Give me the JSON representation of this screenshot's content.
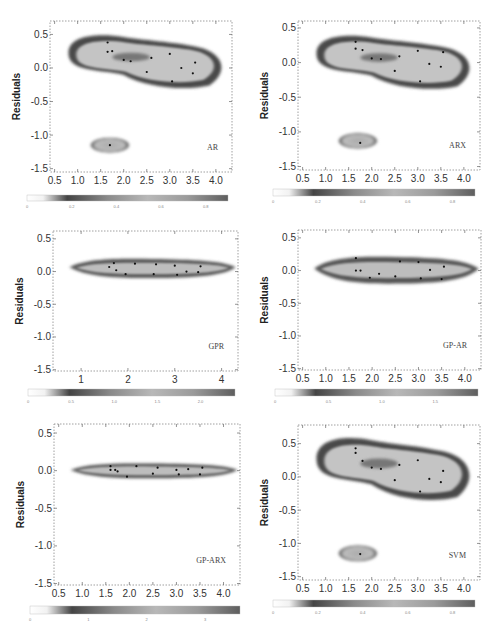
{
  "figure": {
    "header_text": ""
  },
  "chart_data": [
    {
      "type": "heatmap",
      "model": "AR",
      "xlabel": "",
      "ylabel": "Residuals",
      "xlim": [
        0.4,
        4.35
      ],
      "ylim": [
        -1.55,
        0.7
      ],
      "x_ticks": [
        "0.5",
        "1.0",
        "1.5",
        "2.0",
        "2.5",
        "3.0",
        "3.5",
        "4.0"
      ],
      "x_tick_values": [
        0.5,
        1.0,
        1.5,
        2.0,
        2.5,
        3.0,
        3.5,
        4.0
      ],
      "y_ticks": [
        "0.5",
        "0.0",
        "-0.5",
        "-1.0",
        "-1.5"
      ],
      "y_tick_values": [
        0.5,
        0.0,
        -0.5,
        -1.0,
        -1.5
      ],
      "colorbar_ticks": [
        "0",
        "0.2",
        "0.4",
        "0.6",
        "0.8"
      ],
      "colorbar_range": [
        0,
        0.9
      ],
      "points": [
        [
          1.65,
          0.38
        ],
        [
          1.65,
          0.24
        ],
        [
          1.75,
          0.25
        ],
        [
          2.0,
          0.12
        ],
        [
          2.15,
          0.1
        ],
        [
          2.6,
          0.15
        ],
        [
          2.5,
          -0.06
        ],
        [
          3.0,
          0.21
        ],
        [
          3.25,
          0.0
        ],
        [
          3.55,
          0.08
        ],
        [
          3.5,
          -0.08
        ],
        [
          3.05,
          -0.2
        ],
        [
          1.7,
          -1.15
        ]
      ],
      "density_blobs": [
        {
          "shape": "main",
          "cx_range": [
            0.8,
            4.2
          ],
          "cy_range": [
            -0.3,
            0.5
          ]
        },
        {
          "shape": "outlier",
          "cx": 1.7,
          "cy": -1.15,
          "rx": 0.45,
          "ry": 0.12
        }
      ],
      "grid": false
    },
    {
      "type": "heatmap",
      "model": "ARX",
      "xlabel": "",
      "ylabel": "Residuals",
      "xlim": [
        0.4,
        4.35
      ],
      "ylim": [
        -1.55,
        0.6
      ],
      "x_ticks": [
        "0.5",
        "1.0",
        "1.5",
        "2.0",
        "2.5",
        "3.0",
        "3.5",
        "4.0"
      ],
      "x_tick_values": [
        0.5,
        1.0,
        1.5,
        2.0,
        2.5,
        3.0,
        3.5,
        4.0
      ],
      "y_ticks": [
        "0.5",
        "0.0",
        "-0.5",
        "-1.0",
        "-1.5"
      ],
      "y_tick_values": [
        0.5,
        0.0,
        -0.5,
        -1.0,
        -1.5
      ],
      "colorbar_ticks": [
        "0",
        "0.2",
        "0.4",
        "0.6",
        "0.8"
      ],
      "colorbar_range": [
        0,
        0.9
      ],
      "points": [
        [
          1.65,
          0.3
        ],
        [
          1.65,
          0.2
        ],
        [
          1.8,
          0.18
        ],
        [
          2.0,
          0.06
        ],
        [
          2.2,
          0.05
        ],
        [
          2.6,
          0.09
        ],
        [
          2.5,
          -0.12
        ],
        [
          3.0,
          0.17
        ],
        [
          3.25,
          -0.02
        ],
        [
          3.55,
          0.15
        ],
        [
          3.5,
          -0.06
        ],
        [
          3.05,
          -0.27
        ],
        [
          1.75,
          -1.16
        ]
      ],
      "density_blobs": [
        {
          "shape": "main",
          "cx_range": [
            0.8,
            4.2
          ],
          "cy_range": [
            -0.38,
            0.4
          ]
        },
        {
          "shape": "outlier",
          "cx": 1.7,
          "cy": -1.13,
          "rx": 0.45,
          "ry": 0.12
        }
      ],
      "grid": false
    },
    {
      "type": "heatmap",
      "model": "GPR",
      "xlabel": "",
      "ylabel": "Residuals",
      "xlim": [
        0.4,
        4.35
      ],
      "ylim": [
        -1.52,
        0.62
      ],
      "x_ticks": [
        "1",
        "2",
        "3",
        "4"
      ],
      "x_tick_values": [
        1,
        2,
        3,
        4
      ],
      "y_ticks": [
        "0.5",
        "0.0",
        "-0.5",
        "-1.0",
        "-1.5"
      ],
      "y_tick_values": [
        0.5,
        0.0,
        -0.5,
        -1.0,
        -1.5
      ],
      "colorbar_ticks": [
        "0",
        "0.5",
        "1.0",
        "1.5",
        "2.0"
      ],
      "colorbar_range": [
        0,
        2.4
      ],
      "points": [
        [
          1.6,
          0.07
        ],
        [
          1.7,
          0.13
        ],
        [
          1.75,
          0.02
        ],
        [
          1.95,
          -0.04
        ],
        [
          2.15,
          0.12
        ],
        [
          2.55,
          -0.04
        ],
        [
          2.6,
          0.11
        ],
        [
          3.0,
          0.09
        ],
        [
          3.05,
          -0.05
        ],
        [
          3.25,
          0.0
        ],
        [
          3.5,
          -0.01
        ],
        [
          3.55,
          0.08
        ]
      ],
      "density_blobs": [
        {
          "shape": "band",
          "cx_range": [
            0.75,
            4.3
          ],
          "cy_range": [
            -0.1,
            0.2
          ]
        }
      ],
      "grid": false
    },
    {
      "type": "heatmap",
      "model": "GP-AR",
      "xlabel": "",
      "ylabel": "Residuals",
      "xlim": [
        0.4,
        4.35
      ],
      "ylim": [
        -1.52,
        0.62
      ],
      "x_ticks": [
        "0.5",
        "1.0",
        "1.5",
        "2.0",
        "2.5",
        "3.0",
        "3.5",
        "4.0"
      ],
      "x_tick_values": [
        0.5,
        1.0,
        1.5,
        2.0,
        2.5,
        3.0,
        3.5,
        4.0
      ],
      "y_ticks": [
        "0.5",
        "0.0",
        "-0.5",
        "-1.0",
        "-1.5"
      ],
      "y_tick_values": [
        0.5,
        0.0,
        -0.5,
        -1.0,
        -1.5
      ],
      "colorbar_ticks": [
        "0",
        "0.5",
        "1.0",
        "1.5"
      ],
      "colorbar_range": [
        0,
        1.9
      ],
      "points": [
        [
          1.65,
          0.19
        ],
        [
          1.65,
          0.0
        ],
        [
          1.75,
          0.0
        ],
        [
          1.95,
          -0.11
        ],
        [
          2.15,
          -0.05
        ],
        [
          2.5,
          -0.09
        ],
        [
          2.6,
          0.14
        ],
        [
          3.0,
          0.13
        ],
        [
          3.05,
          -0.12
        ],
        [
          3.25,
          0.01
        ],
        [
          3.5,
          -0.13
        ],
        [
          3.55,
          0.06
        ]
      ],
      "density_blobs": [
        {
          "shape": "band",
          "cx_range": [
            0.75,
            4.3
          ],
          "cy_range": [
            -0.2,
            0.22
          ]
        }
      ],
      "grid": false
    },
    {
      "type": "heatmap",
      "model": "GP-ARX",
      "xlabel": "",
      "ylabel": "Residuals",
      "xlim": [
        0.4,
        4.35
      ],
      "ylim": [
        -1.52,
        0.62
      ],
      "x_ticks": [
        "0.5",
        "1.0",
        "1.5",
        "2.0",
        "2.5",
        "3.0",
        "3.5",
        "4.0"
      ],
      "x_tick_values": [
        0.5,
        1.0,
        1.5,
        2.0,
        2.5,
        3.0,
        3.5,
        4.0
      ],
      "y_ticks": [
        "0.5",
        "0.0",
        "-0.5",
        "-1.0",
        "-1.5"
      ],
      "y_tick_values": [
        0.5,
        0.0,
        -0.5,
        -1.0,
        -1.5
      ],
      "colorbar_ticks": [
        "0",
        "1",
        "2",
        "3"
      ],
      "colorbar_range": [
        0,
        3.6
      ],
      "points": [
        [
          1.6,
          0.06
        ],
        [
          1.6,
          0.01
        ],
        [
          1.7,
          0.01
        ],
        [
          1.75,
          -0.01
        ],
        [
          1.95,
          -0.08
        ],
        [
          2.15,
          0.06
        ],
        [
          2.5,
          -0.04
        ],
        [
          2.6,
          0.04
        ],
        [
          3.0,
          0.01
        ],
        [
          3.05,
          -0.05
        ],
        [
          3.25,
          0.02
        ],
        [
          3.5,
          -0.05
        ],
        [
          3.55,
          0.04
        ]
      ],
      "density_blobs": [
        {
          "shape": "band",
          "cx_range": [
            0.75,
            4.3
          ],
          "cy_range": [
            -0.1,
            0.1
          ]
        }
      ],
      "grid": false
    },
    {
      "type": "heatmap",
      "model": "SVM",
      "xlabel": "",
      "ylabel": "Residuals",
      "xlim": [
        0.4,
        4.35
      ],
      "ylim": [
        -1.55,
        0.78
      ],
      "x_ticks": [
        "0.5",
        "1.0",
        "1.5",
        "2.0",
        "2.5",
        "3.0",
        "3.5",
        "4.0"
      ],
      "x_tick_values": [
        0.5,
        1.0,
        1.5,
        2.0,
        2.5,
        3.0,
        3.5,
        4.0
      ],
      "y_ticks": [
        "0.5",
        "0.0",
        "-0.5",
        "-1.0",
        "-1.5"
      ],
      "y_tick_values": [
        0.5,
        0.0,
        -0.5,
        -1.0,
        -1.5
      ],
      "colorbar_ticks": [
        "0",
        "0.2",
        "0.4",
        "0.6",
        "0.8"
      ],
      "colorbar_range": [
        0,
        0.9
      ],
      "points": [
        [
          1.65,
          0.43
        ],
        [
          1.65,
          0.36
        ],
        [
          1.8,
          0.24
        ],
        [
          2.0,
          0.14
        ],
        [
          2.2,
          0.12
        ],
        [
          2.6,
          0.18
        ],
        [
          2.5,
          -0.05
        ],
        [
          3.0,
          0.25
        ],
        [
          3.25,
          -0.03
        ],
        [
          3.55,
          0.09
        ],
        [
          3.5,
          -0.08
        ],
        [
          3.05,
          -0.22
        ],
        [
          1.75,
          -1.16
        ]
      ],
      "density_blobs": [
        {
          "shape": "main",
          "cx_range": [
            0.8,
            4.2
          ],
          "cy_range": [
            -0.35,
            0.6
          ]
        },
        {
          "shape": "outlier",
          "cx": 1.7,
          "cy": -1.15,
          "rx": 0.45,
          "ry": 0.13
        }
      ],
      "grid": false
    }
  ],
  "panels": [
    {
      "model_label": "AR",
      "ylabel": "Residuals"
    },
    {
      "model_label": "ARX",
      "ylabel": "Residuals"
    },
    {
      "model_label": "GPR",
      "ylabel": "Residuals"
    },
    {
      "model_label": "GP-AR",
      "ylabel": "Residuals"
    },
    {
      "model_label": "GP-ARX",
      "ylabel": "Residuals"
    },
    {
      "model_label": "SVM",
      "ylabel": "Residuals"
    }
  ]
}
